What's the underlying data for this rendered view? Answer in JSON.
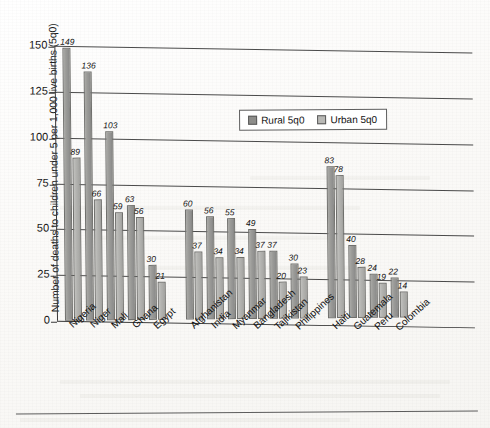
{
  "chart_data": {
    "type": "bar",
    "title": "",
    "xlabel": "",
    "ylabel": "Number of deaths to children under 5 per 1,000 live births (5q0)",
    "ylim": [
      0,
      150
    ],
    "yticks": [
      0,
      25,
      50,
      75,
      100,
      125,
      150
    ],
    "grid": true,
    "legend_position": "top-center",
    "categories": [
      "Nigeria",
      "Niger",
      "Mali",
      "Ghana",
      "Egypt",
      "Afghanistan",
      "India",
      "Myanmar",
      "Bangladesh",
      "Tajikistan",
      "Philippines",
      "Haiti",
      "Guatemala",
      "Peru",
      "Colombia"
    ],
    "series": [
      {
        "name": "Rural 5q0",
        "values": [
          149,
          136,
          103,
          63,
          30,
          60,
          56,
          55,
          49,
          37,
          30,
          83,
          40,
          24,
          22
        ],
        "color": "#8d8d8a"
      },
      {
        "name": "Urban 5q0",
        "values": [
          89,
          66,
          59,
          56,
          21,
          37,
          34,
          34,
          37,
          20,
          23,
          78,
          28,
          19,
          14
        ],
        "color": "#b9b9b6"
      }
    ],
    "groups": [
      {
        "label": "",
        "members": [
          "Nigeria",
          "Niger",
          "Mali",
          "Ghana",
          "Egypt"
        ]
      },
      {
        "label": "",
        "members": [
          "Afghanistan",
          "India",
          "Myanmar",
          "Bangladesh",
          "Tajikistan",
          "Philippines"
        ]
      },
      {
        "label": "",
        "members": [
          "Haiti",
          "Guatemala",
          "Peru",
          "Colombia"
        ]
      }
    ],
    "data_labels_shown": true
  },
  "axis": {
    "y_title": "Number of deaths to children under 5 per 1,000 live births (5q0)",
    "y_ticks": [
      "150",
      "125",
      "100",
      "75",
      "50",
      "25",
      "0"
    ]
  },
  "legend": {
    "rural_label": "Rural 5q0",
    "urban_label": "Urban 5q0"
  }
}
